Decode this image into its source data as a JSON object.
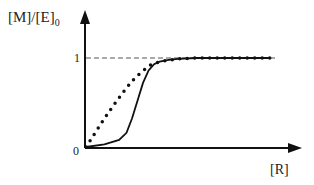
{
  "chart_data": {
    "type": "line",
    "title": "",
    "xlabel": "[R]",
    "ylabel": "[M]/[E]0",
    "ylabel_main": "[M]/[E]",
    "ylabel_sub": "0",
    "y_ticks": [
      "0",
      "1"
    ],
    "ylim": [
      0,
      1.0
    ],
    "reference_line": {
      "y": 1,
      "style": "dashed"
    },
    "series": [
      {
        "name": "hyperbolic",
        "style": "dotted",
        "x": [
          0,
          0.05,
          0.1,
          0.15,
          0.2,
          0.25,
          0.3,
          0.35,
          0.4,
          0.5,
          0.6,
          0.7,
          0.8,
          0.9,
          1.0
        ],
        "y": [
          0,
          0.16,
          0.32,
          0.47,
          0.61,
          0.74,
          0.84,
          0.92,
          0.96,
          0.99,
          1.0,
          1.0,
          1.0,
          1.0,
          1.0
        ]
      },
      {
        "name": "sigmoidal",
        "style": "solid",
        "x": [
          0,
          0.1,
          0.18,
          0.22,
          0.25,
          0.28,
          0.31,
          0.34,
          0.37,
          0.4,
          0.45,
          0.5,
          0.6,
          0.7,
          0.8,
          0.9,
          1.0
        ],
        "y": [
          0,
          0.03,
          0.08,
          0.16,
          0.32,
          0.52,
          0.72,
          0.86,
          0.93,
          0.96,
          0.98,
          0.99,
          1.0,
          1.0,
          1.0,
          1.0,
          1.0
        ]
      }
    ],
    "grid": false,
    "legend": null
  }
}
